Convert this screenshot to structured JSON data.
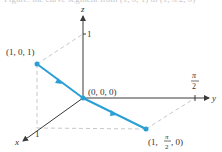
{
  "caption": "Figure: the curve segment from (1, 0, 1) to (1, π/2, 0)",
  "axes": {
    "x_label": "x",
    "y_label": "y",
    "z_label": "z",
    "x_tick": "1",
    "z_tick": "1",
    "y_tick_num": "π",
    "y_tick_den": "2"
  },
  "points": {
    "start": "(1, 0, 1)",
    "origin": "(0, 0, 0)",
    "end_prefix": "(1, ",
    "end_num": "π",
    "end_den": "2",
    "end_suffix": ", 0)"
  },
  "colors": {
    "path": "#2a9fd6",
    "axis": "#3a3a3a",
    "dashed": "#c8c8c8"
  }
}
